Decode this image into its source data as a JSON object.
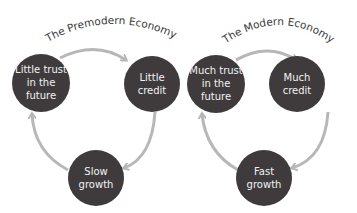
{
  "colors": {
    "node_fill": "#3f3b3c",
    "arrow": "#b7b7b7",
    "node_text": "#f2f2f2",
    "title": "#3a3a3a"
  },
  "diagrams": [
    {
      "title": "The Premodern Economy",
      "nodes": [
        {
          "lines": [
            "Little trust",
            "in the",
            "future"
          ]
        },
        {
          "lines": [
            "Little",
            "credit"
          ]
        },
        {
          "lines": [
            "Slow",
            "growth"
          ]
        }
      ]
    },
    {
      "title": "The Modern Economy",
      "nodes": [
        {
          "lines": [
            "Much trust",
            "in the",
            "future"
          ]
        },
        {
          "lines": [
            "Much",
            "credit"
          ]
        },
        {
          "lines": [
            "Fast",
            "growth"
          ]
        }
      ]
    }
  ]
}
